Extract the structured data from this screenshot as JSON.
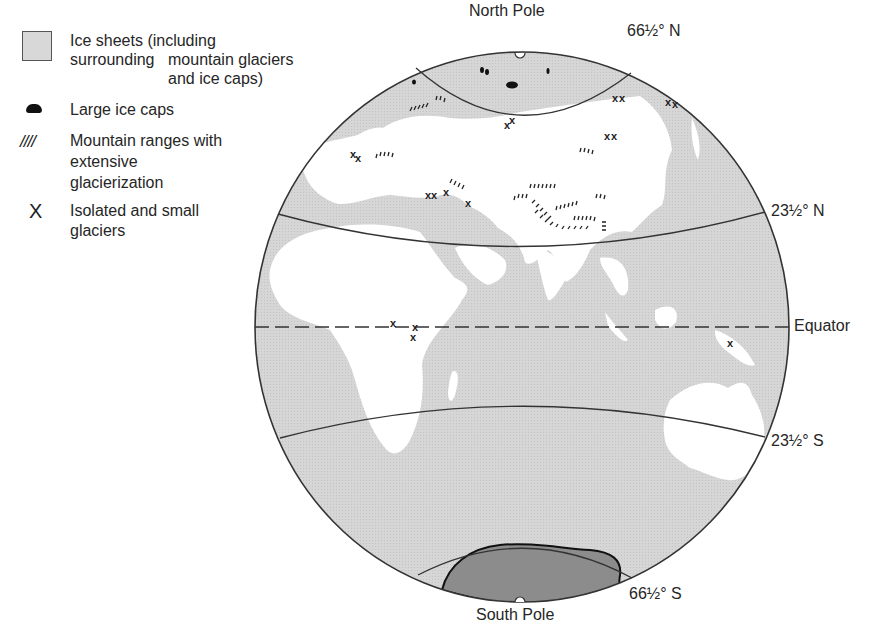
{
  "legend": {
    "items": [
      {
        "symbol": "ice-sheet-swatch",
        "lines": [
          "Ice sheets (including surrounding",
          "mountain glaciers",
          "and ice caps)"
        ]
      },
      {
        "symbol": "ice-cap-blob",
        "lines": [
          "Large ice caps"
        ]
      },
      {
        "symbol": "mountain-hatch",
        "glyph": "////",
        "lines": [
          "Mountain ranges with",
          "extensive",
          "glacierization"
        ]
      },
      {
        "symbol": "x-mark",
        "glyph": "X",
        "lines": [
          "Isolated and small",
          "glaciers"
        ]
      }
    ]
  },
  "globe": {
    "labels": {
      "north_pole": "North Pole",
      "south_pole": "South Pole",
      "arctic_circle": "66½° N",
      "tropic_cancer": "23½° N",
      "equator": "Equator",
      "tropic_capricorn": "23½° S",
      "antarctic_circle": "66½° S"
    },
    "colors": {
      "ocean": "#d4d4d4",
      "land": "#ffffff",
      "antarctic_ice": "#8c8c8c",
      "lines": "#333333"
    }
  }
}
